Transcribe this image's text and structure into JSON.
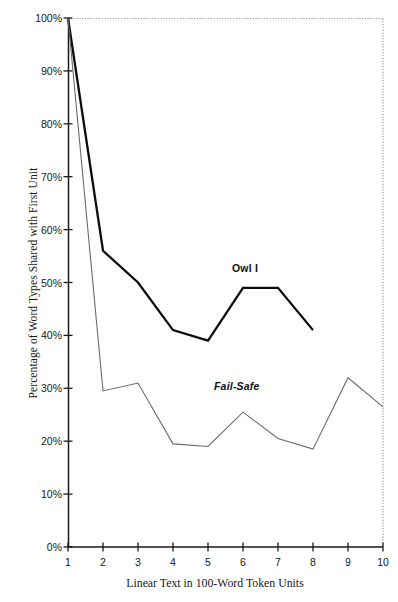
{
  "chart_data": {
    "type": "line",
    "title": "",
    "xlabel": "Linear Text in 100-Word Token Units",
    "ylabel": "Percentage of Word Types Shared with First Unit",
    "x": [
      1,
      2,
      3,
      4,
      5,
      6,
      7,
      8,
      9,
      10
    ],
    "xlim": [
      1,
      10
    ],
    "ylim": [
      0,
      100
    ],
    "grid": false,
    "legend_position": "inline-annotation",
    "xtick_labels": [
      "1",
      "2",
      "3",
      "4",
      "5",
      "6",
      "7",
      "8",
      "9",
      "10"
    ],
    "ytick_labels": [
      "0%",
      "10%",
      "20%",
      "30%",
      "40%",
      "50%",
      "60%",
      "70%",
      "80%",
      "90%",
      "100%"
    ],
    "ytick_values": [
      0,
      10,
      20,
      30,
      40,
      50,
      60,
      70,
      80,
      90,
      100
    ],
    "series": [
      {
        "name": "Owl I",
        "color": "#0d0d0d",
        "width": 2.3,
        "style": "solid",
        "x": [
          1,
          2,
          3,
          4,
          5,
          6,
          7,
          8
        ],
        "values": [
          100,
          56,
          50,
          41,
          39,
          49,
          49,
          41
        ]
      },
      {
        "name": "Fail-Safe",
        "color": "#6b6b6b",
        "width": 1.1,
        "style": "solid",
        "x": [
          1,
          2,
          3,
          4,
          5,
          6,
          7,
          8,
          9,
          10
        ],
        "values": [
          100,
          29.5,
          31,
          19.5,
          19,
          25.5,
          20.5,
          18.5,
          32,
          26.5
        ]
      }
    ],
    "annotations": [
      {
        "text": "Owl I",
        "series": "Owl I",
        "bold": true,
        "italic": false
      },
      {
        "text": "Fail-Safe",
        "series": "Fail-Safe",
        "bold": true,
        "italic": true
      }
    ],
    "axis_colors": {
      "spine": "#1a1a1a",
      "dotted_border": "#9a9a9a",
      "background": "#ffffff"
    }
  }
}
